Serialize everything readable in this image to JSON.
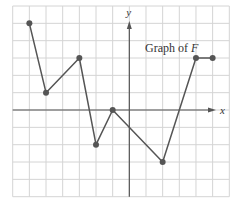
{
  "title": {
    "prefix": "Graph of ",
    "function_name": "F"
  },
  "axes": {
    "x_label": "x",
    "y_label": "y"
  },
  "colors": {
    "curve": "#555555",
    "grid": "#d4d4d4",
    "axis": "#555555"
  },
  "chart_data": {
    "type": "line",
    "title": "Graph of F",
    "xlabel": "x",
    "ylabel": "y",
    "xlim": [
      -7,
      6
    ],
    "ylim": [
      -5,
      6
    ],
    "grid": true,
    "tick_labels": false,
    "series": [
      {
        "name": "F",
        "points": [
          {
            "x": -6,
            "y": 5
          },
          {
            "x": -5,
            "y": 1
          },
          {
            "x": -3,
            "y": 3
          },
          {
            "x": -2,
            "y": -2
          },
          {
            "x": -1,
            "y": 0
          },
          {
            "x": 2,
            "y": -3
          },
          {
            "x": 4,
            "y": 3
          },
          {
            "x": 5,
            "y": 3
          }
        ]
      }
    ]
  }
}
